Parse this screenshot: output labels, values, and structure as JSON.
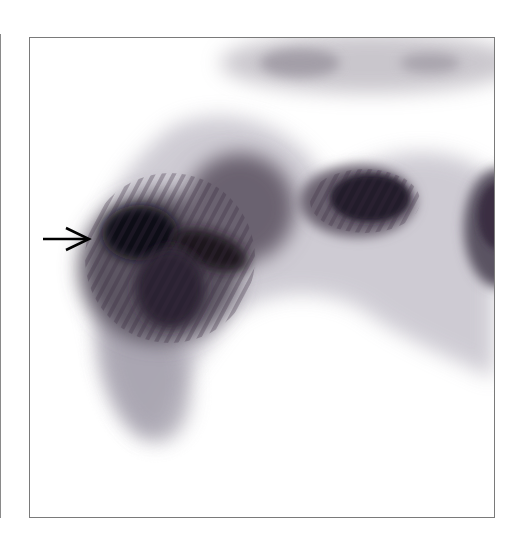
{
  "figure": {
    "type": "scintigraphy-image",
    "colors": {
      "background": "#ffffff",
      "frame_border": "#7a7a7a",
      "uptake_dark": "#120c18",
      "uptake_mid": "#5a5060",
      "uptake_light": "#c8c6d0",
      "arrow": "#000000"
    },
    "annotations": [
      {
        "kind": "arrow",
        "direction": "right",
        "points_to": "focal-uptake-left-lobe"
      }
    ]
  }
}
